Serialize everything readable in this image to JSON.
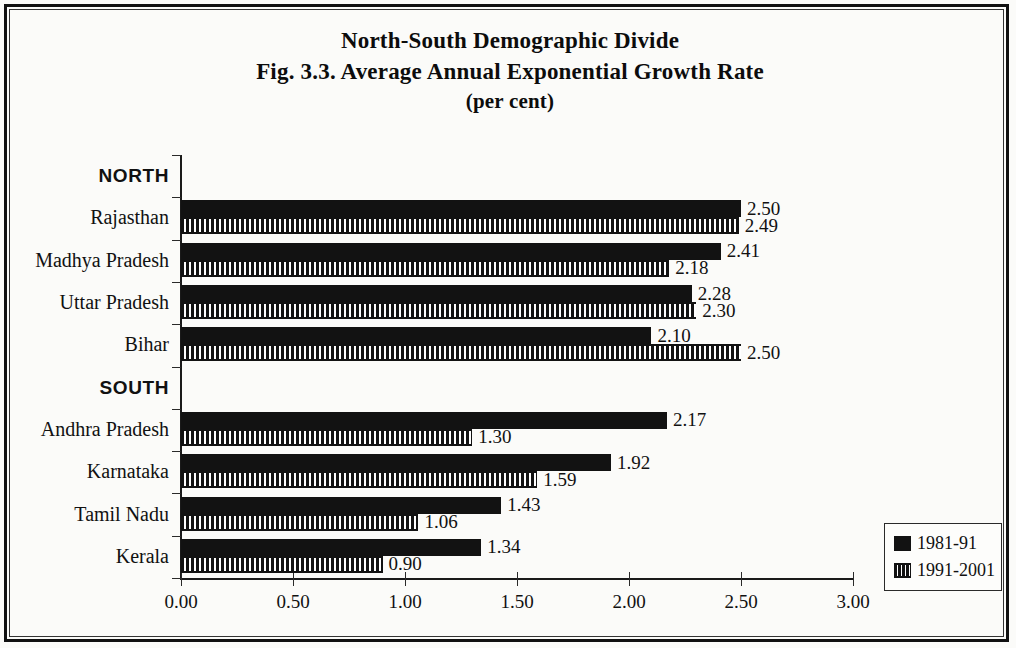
{
  "figure": {
    "title_line_1": "North-South Demographic Divide",
    "title_line_2": "Fig. 3.3. Average Annual Exponential Growth Rate",
    "title_line_3": "(per cent)"
  },
  "chart_data": {
    "type": "bar",
    "orientation": "horizontal",
    "xlabel": "",
    "ylabel": "",
    "xlim": [
      0.0,
      3.0
    ],
    "xticks": [
      "0.00",
      "0.50",
      "1.00",
      "1.50",
      "2.00",
      "2.50",
      "3.00"
    ],
    "xtick_values": [
      0.0,
      0.5,
      1.0,
      1.5,
      2.0,
      2.5,
      3.0
    ],
    "grid": false,
    "legend_position": "bottom-right",
    "group_headers": [
      "NORTH",
      "SOUTH"
    ],
    "categories": [
      "Rajasthan",
      "Madhya Pradesh",
      "Uttar Pradesh",
      "Bihar",
      "Andhra Pradesh",
      "Karnataka",
      "Tamil Nadu",
      "Kerala"
    ],
    "series": [
      {
        "name": "1981-91",
        "values": [
          2.5,
          2.41,
          2.28,
          2.1,
          2.17,
          1.92,
          1.43,
          1.34
        ],
        "labels": [
          "2.50",
          "2.41",
          "2.28",
          "2.10",
          "2.17",
          "1.92",
          "1.43",
          "1.34"
        ],
        "fill": "solid-black",
        "color": "#121212"
      },
      {
        "name": "1991-2001",
        "values": [
          2.49,
          2.18,
          2.3,
          2.5,
          1.3,
          1.59,
          1.06,
          0.9
        ],
        "labels": [
          "2.49",
          "2.18",
          "2.30",
          "2.50",
          "1.30",
          "1.59",
          "1.06",
          "0.90"
        ],
        "fill": "vertical-hatch",
        "color": "#121212"
      }
    ]
  },
  "rows": [
    {
      "kind": "group",
      "label": "NORTH"
    },
    {
      "kind": "bars",
      "label": "Rajasthan",
      "v1": "2.50",
      "v2": "2.49"
    },
    {
      "kind": "bars",
      "label": "Madhya Pradesh",
      "v1": "2.41",
      "v2": "2.18"
    },
    {
      "kind": "bars",
      "label": "Uttar Pradesh",
      "v1": "2.28",
      "v2": "2.30"
    },
    {
      "kind": "bars",
      "label": "Bihar",
      "v1": "2.10",
      "v2": "2.50"
    },
    {
      "kind": "group",
      "label": "SOUTH"
    },
    {
      "kind": "bars",
      "label": "Andhra Pradesh",
      "v1": "2.17",
      "v2": "1.30"
    },
    {
      "kind": "bars",
      "label": "Karnataka",
      "v1": "1.92",
      "v2": "1.59"
    },
    {
      "kind": "bars",
      "label": "Tamil Nadu",
      "v1": "1.43",
      "v2": "1.06"
    },
    {
      "kind": "bars",
      "label": "Kerala",
      "v1": "1.34",
      "v2": "0.90"
    }
  ],
  "legend": {
    "items": [
      {
        "label": "1981-91"
      },
      {
        "label": "1991-2001"
      }
    ]
  }
}
